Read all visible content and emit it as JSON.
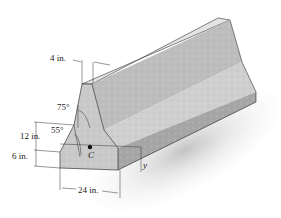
{
  "figure": {
    "dimensions": {
      "top_width": "4 in.",
      "upper_height": "12 in.",
      "base_height": "6 in.",
      "base_width": "24 in."
    },
    "angles": {
      "upper_face": "75°",
      "lower_face": "55°"
    },
    "points": {
      "centroid": "C"
    },
    "axes": {
      "vertical": "y"
    },
    "colors": {
      "concrete_light": "#d4d4d4",
      "concrete_mid": "#b9b9b9",
      "concrete_dark": "#a3a3a3",
      "shadow": "#c8c8c8",
      "line": "#333333"
    }
  }
}
